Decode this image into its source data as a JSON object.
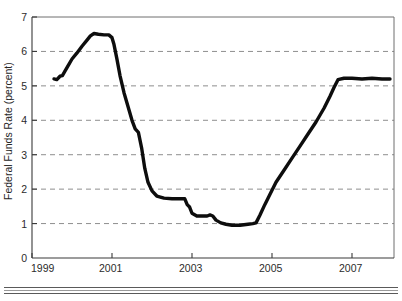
{
  "figure": {
    "background_color": "#ffffff",
    "line_color": "#0d0d0d",
    "grid_color": "#8e8e8e",
    "axis_color": "#3a3a3a",
    "frame_color": "#6e6e6e"
  },
  "chart_data": {
    "type": "line",
    "title": "",
    "subtitle": "",
    "xlabel": "",
    "ylabel": "Federal Funds Rate (percent)",
    "xlim": [
      1999.0,
      2008.05
    ],
    "ylim": [
      0,
      7
    ],
    "grid": true,
    "grid_axis": "y",
    "legend": null,
    "legend_position": "none",
    "x_ticks": [
      1999,
      2001,
      2003,
      2005,
      2007
    ],
    "x_tick_labels": [
      "1999",
      "2001",
      "2003",
      "2005",
      "2007"
    ],
    "x_minor_ticks": [
      2000,
      2002,
      2004,
      2006,
      2008
    ],
    "y_ticks": [
      0,
      1,
      2,
      3,
      4,
      5,
      6,
      7
    ],
    "y_tick_labels": [
      "0",
      "1",
      "2",
      "3",
      "4",
      "5",
      "6",
      "7"
    ],
    "gridline_values": [
      1,
      2,
      3,
      4,
      5,
      6
    ],
    "series": [
      {
        "name": "Federal Funds Rate",
        "color": "#0d0d0d",
        "x": [
          1999.55,
          1999.62,
          1999.7,
          1999.76,
          1999.82,
          1999.9,
          2000.0,
          2000.12,
          2000.25,
          2000.37,
          2000.46,
          2000.55,
          2000.66,
          2000.8,
          2000.92,
          2001.0,
          2001.05,
          2001.12,
          2001.2,
          2001.3,
          2001.4,
          2001.5,
          2001.58,
          2001.66,
          2001.74,
          2001.82,
          2001.9,
          2002.0,
          2002.12,
          2002.3,
          2002.5,
          2002.7,
          2002.82,
          2002.88,
          2002.94,
          2003.0,
          2003.12,
          2003.25,
          2003.38,
          2003.45,
          2003.52,
          2003.6,
          2003.72,
          2003.85,
          2004.0,
          2004.2,
          2004.4,
          2004.52,
          2004.6,
          2004.7,
          2004.82,
          2004.95,
          2005.1,
          2005.3,
          2005.5,
          2005.7,
          2005.9,
          2006.1,
          2006.3,
          2006.45,
          2006.55,
          2006.65,
          2006.8,
          2007.0,
          2007.25,
          2007.5,
          2007.75,
          2007.95
        ],
        "y": [
          5.2,
          5.18,
          5.28,
          5.3,
          5.42,
          5.58,
          5.78,
          5.95,
          6.15,
          6.32,
          6.45,
          6.52,
          6.5,
          6.48,
          6.48,
          6.4,
          6.2,
          5.8,
          5.3,
          4.8,
          4.4,
          4.0,
          3.75,
          3.65,
          3.2,
          2.6,
          2.2,
          1.95,
          1.8,
          1.74,
          1.72,
          1.72,
          1.72,
          1.55,
          1.48,
          1.3,
          1.22,
          1.22,
          1.22,
          1.25,
          1.22,
          1.1,
          1.02,
          0.98,
          0.95,
          0.95,
          0.98,
          1.0,
          1.02,
          1.25,
          1.55,
          1.85,
          2.2,
          2.55,
          2.9,
          3.25,
          3.6,
          3.95,
          4.35,
          4.7,
          4.95,
          5.18,
          5.22,
          5.22,
          5.2,
          5.22,
          5.2,
          5.2
        ]
      }
    ]
  },
  "footer": {
    "divider": "double-horizontal-rule"
  }
}
